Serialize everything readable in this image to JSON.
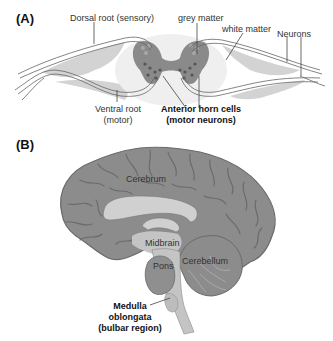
{
  "panels": {
    "a": {
      "label": "(A)",
      "title_hint": "spinal cord cross-section",
      "labels": {
        "dorsal_root": "Dorsal root (sensory)",
        "grey_matter": "grey matter",
        "white_matter": "white matter",
        "neurons": "Neurons",
        "ventral_root_1": "Ventral root",
        "ventral_root_2": "(motor)",
        "anterior_horn_1": "Anterior horn cells",
        "anterior_horn_2": "(motor neurons)"
      }
    },
    "b": {
      "label": "(B)",
      "title_hint": "sagittal brain section",
      "labels": {
        "cerebrum": "Cerebrum",
        "midbrain": "Midbrain",
        "cerebellum": "Cerebellum",
        "pons": "Pons",
        "medulla_1": "Medulla",
        "medulla_2": "oblongata",
        "medulla_3": "(bulbar region)"
      }
    }
  },
  "colors": {
    "grey_matter": "#8a8a8a",
    "white_matter": "#ededed",
    "root_fill": "#c8c8c8",
    "brain_fill": "#8c8c8c",
    "brain_sulci": "#6a6a6a",
    "brainstem": "#c4c4c4",
    "outline": "#555555"
  }
}
